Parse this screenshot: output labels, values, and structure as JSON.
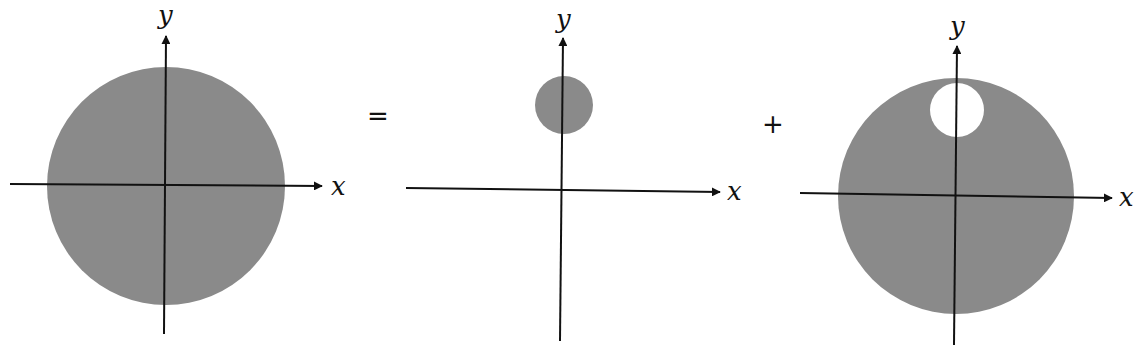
{
  "colors": {
    "fill": "#8a8a8a",
    "axis": "#111111",
    "background": "#ffffff"
  },
  "operators": {
    "equals": "=",
    "plus": "+"
  },
  "panels": [
    {
      "name": "full-disk",
      "x_label": "x",
      "y_label": "y",
      "shape": "solid disk centered at origin"
    },
    {
      "name": "small-disk",
      "x_label": "x",
      "y_label": "y",
      "shape": "small solid disk on positive y-axis, above origin"
    },
    {
      "name": "disk-with-hole",
      "x_label": "x",
      "y_label": "y",
      "shape": "solid disk centered at origin with circular hole on positive y-axis"
    }
  ]
}
